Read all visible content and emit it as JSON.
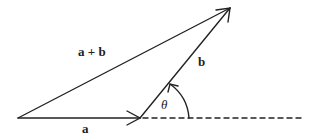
{
  "diagram": {
    "labels": {
      "sum": "a + b",
      "a": "a",
      "b": "b",
      "angle": "θ"
    },
    "colors": {
      "stroke": "#222222",
      "background": "#ffffff"
    }
  }
}
